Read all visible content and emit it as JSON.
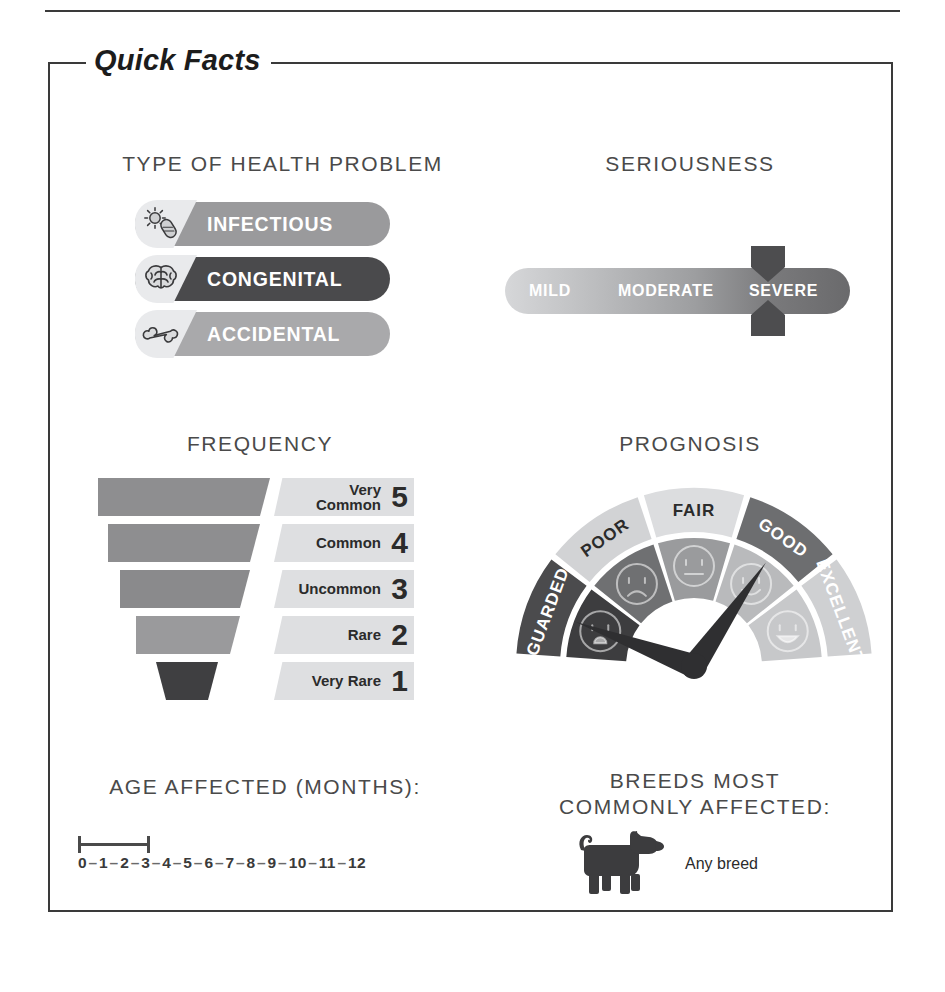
{
  "frame": {
    "title": "Quick Facts"
  },
  "type_of_health_problem": {
    "heading": "TYPE OF HEALTH PROBLEM",
    "options": [
      {
        "label": "INFECTIOUS",
        "icon": "germ-icon",
        "color": "#9a9a9c",
        "selected": false
      },
      {
        "label": "CONGENITAL",
        "icon": "brain-icon",
        "color": "#4a4a4c",
        "selected": true
      },
      {
        "label": "ACCIDENTAL",
        "icon": "bone-icon",
        "color": "#a9a9ab",
        "selected": false
      }
    ]
  },
  "seriousness": {
    "heading": "SERIOUSNESS",
    "levels": [
      "MILD",
      "MODERATE",
      "SEVERE"
    ],
    "selected": "SEVERE",
    "marker_color": "#4d4d4f"
  },
  "frequency": {
    "heading": "FREQUENCY",
    "selected_value": 1,
    "levels": [
      {
        "name": "Very\nCommon",
        "value": "5",
        "color": "#8e8e90",
        "width": 172
      },
      {
        "name": "Common",
        "value": "4",
        "color": "#8e8e90",
        "width": 148
      },
      {
        "name": "Uncommon",
        "value": "3",
        "color": "#8a8a8c",
        "width": 124
      },
      {
        "name": "Rare",
        "value": "2",
        "color": "#9a9a9c",
        "width": 100
      },
      {
        "name": "Very Rare",
        "value": "1",
        "color": "#3f3f41",
        "width": 62
      }
    ]
  },
  "prognosis": {
    "heading": "PROGNOSIS",
    "segments": [
      {
        "label": "GUARDED",
        "outer_color": "#4b4b4d",
        "inner_color": "#3d3d3f",
        "text_color": "#ffffff",
        "face": "distressed"
      },
      {
        "label": "POOR",
        "outer_color": "#d2d3d5",
        "inner_color": "#6f7072",
        "text_color": "#2b2b2b",
        "face": "sad"
      },
      {
        "label": "FAIR",
        "outer_color": "#dcdddf",
        "inner_color": "#9a9b9d",
        "text_color": "#2b2b2b",
        "face": "neutral"
      },
      {
        "label": "GOOD",
        "outer_color": "#6d6e70",
        "inner_color": "#b9babc",
        "text_color": "#ffffff",
        "face": "happy"
      },
      {
        "label": "EXCELLENT",
        "outer_color": "#cfd0d2",
        "inner_color": "#c7c8ca",
        "text_color": "#ffffff",
        "face": "very-happy"
      }
    ],
    "needle_color": "#2f2f31",
    "needles": [
      "GUARDED",
      "GOOD"
    ]
  },
  "age_affected": {
    "heading": "AGE AFFECTED (MONTHS):",
    "ticks": [
      "0",
      "1",
      "2",
      "3",
      "4",
      "5",
      "6",
      "7",
      "8",
      "9",
      "10",
      "11",
      "12"
    ],
    "range_start": "0",
    "range_end": "2"
  },
  "breeds": {
    "heading": "BREEDS MOST COMMONLY AFFECTED:",
    "icon": "dog-icon",
    "value": "Any breed"
  }
}
